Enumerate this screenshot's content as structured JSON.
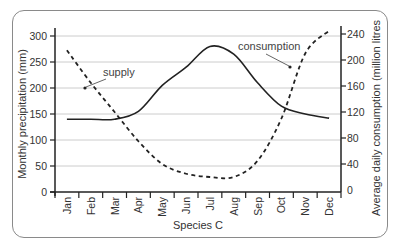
{
  "chart_data": {
    "type": "line",
    "title": "",
    "xlabel": "Species C",
    "ylabel": "Monthly precipitation (mm)",
    "y2label": "Average daily consumption (million litres",
    "categories": [
      "Jan",
      "Feb",
      "Mar",
      "Apr",
      "May",
      "Jun",
      "Jul",
      "Aug",
      "Sep",
      "Oct",
      "Nov",
      "Dec"
    ],
    "ylim": [
      0,
      300
    ],
    "y2lim": [
      0,
      240
    ],
    "yticks": [
      "0",
      "50",
      "100",
      "150",
      "200",
      "250",
      "300"
    ],
    "y2ticks": [
      "0",
      "40",
      "80",
      "120",
      "160",
      "200",
      "240"
    ],
    "grid": true,
    "series": [
      {
        "name": "supply",
        "axis": "left",
        "style": "solid",
        "values": [
          140,
          140,
          140,
          155,
          205,
          240,
          280,
          265,
          210,
          165,
          150,
          142
        ]
      },
      {
        "name": "consumption",
        "axis": "right",
        "style": "dashed",
        "values": [
          215,
          165,
          120,
          75,
          40,
          25,
          20,
          20,
          45,
          110,
          210,
          245
        ]
      }
    ],
    "annotations": [
      {
        "text": "supply",
        "target": "supply"
      },
      {
        "text": "consumption",
        "target": "consumption"
      }
    ]
  },
  "colors": {
    "line": "#222222",
    "grid": "#cccccc",
    "axis": "#222222",
    "frame": "#8a8a8a"
  }
}
